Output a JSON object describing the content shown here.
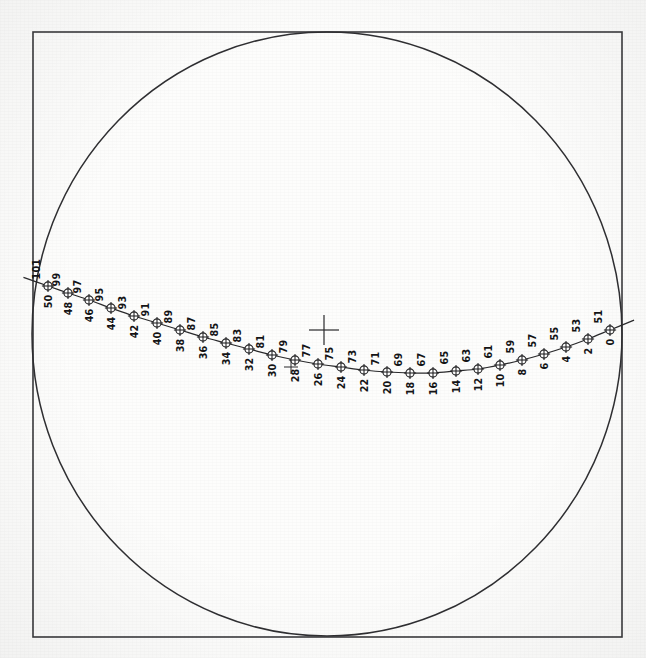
{
  "figure": {
    "kind": "scanned-arc-plot",
    "background_color": "#fdfdfc",
    "ink_color": "#1d1d1f",
    "frame": {
      "shape": "square",
      "x": 33,
      "y": 32,
      "width": 589,
      "height": 605,
      "stroke_color": "#3a3a3c"
    },
    "boundary_circle": {
      "center_x": 327,
      "center_y": 334,
      "radius_x": 295,
      "radius_y": 302,
      "stroke_color": "#2f2f32"
    },
    "reference_cross": {
      "x": 324,
      "y": 330,
      "arm_length": 15,
      "label": "reference-cross"
    },
    "tick_cross": {
      "x": 291,
      "y": 367,
      "arm_length": 7,
      "label": "track-tick-cross"
    }
  },
  "chart_data": {
    "type": "scatter",
    "title": "",
    "subtitle": "",
    "xlabel": "",
    "ylabel": "",
    "grid": false,
    "legend": null,
    "axis_ranges": {
      "x": [
        33,
        622
      ],
      "y": [
        32,
        637
      ]
    },
    "label_orientation_degrees": 90,
    "upper_label_series_name": "odd-index",
    "lower_label_series_name": "even-index",
    "point_count": 26,
    "points": [
      {
        "upper": "101",
        "lower": "50",
        "x": 48,
        "y": 286
      },
      {
        "upper": "99",
        "lower": "48",
        "x": 68,
        "y": 293
      },
      {
        "upper": "97",
        "lower": "46",
        "x": 89,
        "y": 300
      },
      {
        "upper": "95",
        "lower": "44",
        "x": 111,
        "y": 308
      },
      {
        "upper": "93",
        "lower": "42",
        "x": 134,
        "y": 316
      },
      {
        "upper": "91",
        "lower": "40",
        "x": 157,
        "y": 323
      },
      {
        "upper": "89",
        "lower": "38",
        "x": 180,
        "y": 330
      },
      {
        "upper": "87",
        "lower": "36",
        "x": 203,
        "y": 337
      },
      {
        "upper": "85",
        "lower": "34",
        "x": 226,
        "y": 343
      },
      {
        "upper": "83",
        "lower": "32",
        "x": 249,
        "y": 349
      },
      {
        "upper": "81",
        "lower": "30",
        "x": 272,
        "y": 355
      },
      {
        "upper": "79",
        "lower": "28",
        "x": 295,
        "y": 360
      },
      {
        "upper": "77",
        "lower": "26",
        "x": 318,
        "y": 364
      },
      {
        "upper": "75",
        "lower": "24",
        "x": 341,
        "y": 367
      },
      {
        "upper": "73",
        "lower": "22",
        "x": 364,
        "y": 370
      },
      {
        "upper": "71",
        "lower": "20",
        "x": 387,
        "y": 372
      },
      {
        "upper": "69",
        "lower": "18",
        "x": 410,
        "y": 373
      },
      {
        "upper": "67",
        "lower": "16",
        "x": 433,
        "y": 373
      },
      {
        "upper": "65",
        "lower": "14",
        "x": 456,
        "y": 371
      },
      {
        "upper": "63",
        "lower": "12",
        "x": 478,
        "y": 369
      },
      {
        "upper": "61",
        "lower": "10",
        "x": 500,
        "y": 365
      },
      {
        "upper": "59",
        "lower": "8",
        "x": 522,
        "y": 360
      },
      {
        "upper": "57",
        "lower": "6",
        "x": 544,
        "y": 354
      },
      {
        "upper": "55",
        "lower": "4",
        "x": 566,
        "y": 347
      },
      {
        "upper": "53",
        "lower": "2",
        "x": 588,
        "y": 339
      },
      {
        "upper": "51",
        "lower": "0",
        "x": 610,
        "y": 330
      }
    ]
  }
}
